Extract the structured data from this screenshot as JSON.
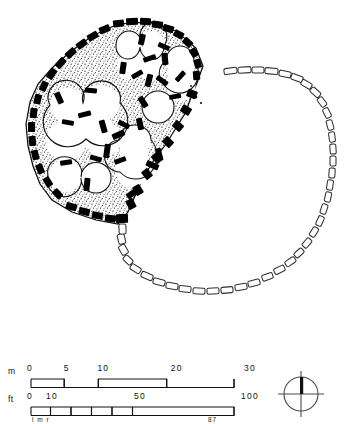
{
  "figure": {
    "kind": "archaeological-site-plan",
    "ink_color": "#000000",
    "paper_color": "#ffffff",
    "rubble_fill_color": "#1a1a1a",
    "enclosure_stroke_color": "#3a3a3a"
  },
  "scalebars": {
    "metres": {
      "unit_label": "m",
      "ticks": [
        "0",
        "5",
        "10",
        "20",
        "30"
      ],
      "tick_values": [
        0,
        5,
        10,
        20,
        30
      ],
      "max": 30
    },
    "feet": {
      "unit_label": "ft",
      "ticks": [
        "0",
        "10",
        "50",
        "100"
      ],
      "tick_values": [
        0,
        10,
        50,
        100
      ],
      "max": 100,
      "left_note": "l m r",
      "right_note": "87"
    }
  },
  "compass": {
    "icon": "north-arrow-icon",
    "north_direction": "up"
  }
}
